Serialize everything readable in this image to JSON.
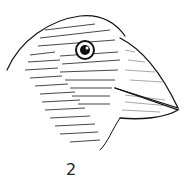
{
  "figure": {
    "label": "2",
    "ink_color": "#111111",
    "paper_color": "#ffffff"
  }
}
